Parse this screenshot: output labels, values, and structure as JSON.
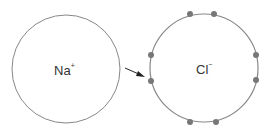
{
  "diagram": {
    "sodium": {
      "symbol": "Na",
      "charge": "+"
    },
    "chlorine": {
      "symbol": "Cl",
      "charge": "−"
    },
    "colors": {
      "circle": "#888888",
      "electron": "#777777",
      "arrow": "#222222"
    }
  }
}
